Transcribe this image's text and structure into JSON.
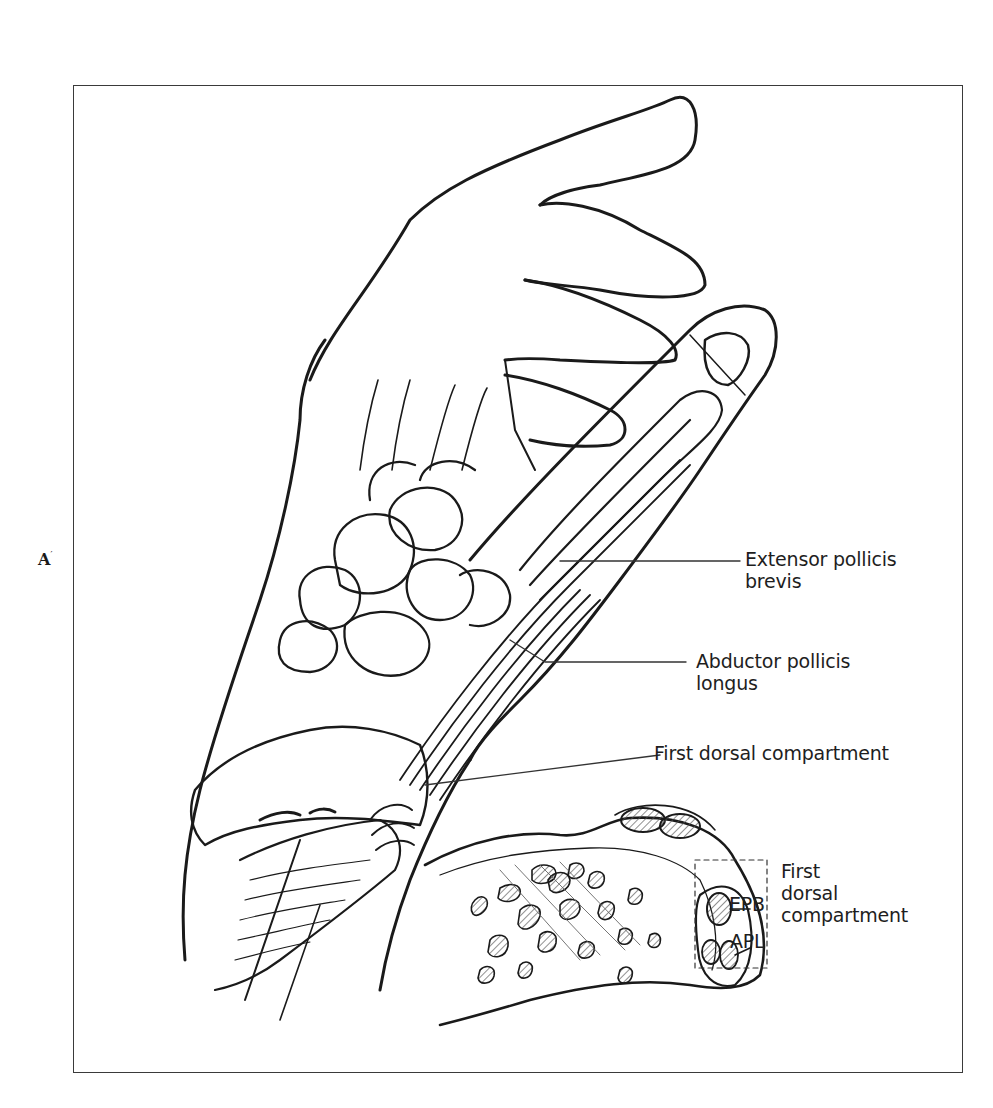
{
  "figure": {
    "panel_letter": "A",
    "panel_letter_mark": "′",
    "callouts": [
      {
        "id": "epb-main",
        "lines": [
          "Extensor pollicis",
          "brevis"
        ]
      },
      {
        "id": "apl-main",
        "lines": [
          "Abductor pollicis",
          "longus"
        ]
      },
      {
        "id": "first-dorsal-main",
        "lines": [
          "First dorsal compartment"
        ]
      }
    ],
    "cross_section": {
      "tendon_labels": [
        "EPB",
        "APL"
      ],
      "compartment_label": [
        "First",
        "dorsal",
        "compartment"
      ]
    },
    "colors": {
      "ink": "#1a1a1a",
      "frame": "#3a3a3a",
      "background": "#ffffff",
      "hatch": "#555555"
    }
  }
}
